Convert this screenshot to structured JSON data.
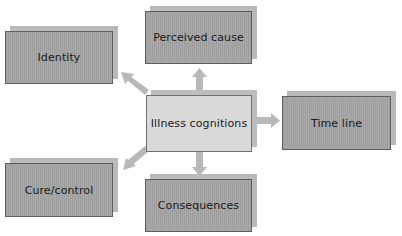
{
  "diagram": {
    "type": "hub-and-spoke concept map",
    "center": {
      "label": "Illness cognitions"
    },
    "nodes": [
      {
        "id": "identity",
        "label": "Identity",
        "position": "upper-left"
      },
      {
        "id": "perceived-cause",
        "label": "Perceived cause",
        "position": "top"
      },
      {
        "id": "time-line",
        "label": "Time line",
        "position": "right"
      },
      {
        "id": "cure-control",
        "label": "Cure/control",
        "position": "lower-left"
      },
      {
        "id": "consequences",
        "label": "Consequences",
        "position": "bottom"
      }
    ],
    "edges": [
      {
        "from": "Illness cognitions",
        "to": "Identity",
        "direction": "outward"
      },
      {
        "from": "Illness cognitions",
        "to": "Perceived cause",
        "direction": "outward"
      },
      {
        "from": "Illness cognitions",
        "to": "Time line",
        "direction": "outward"
      },
      {
        "from": "Illness cognitions",
        "to": "Cure/control",
        "direction": "outward"
      },
      {
        "from": "Illness cognitions",
        "to": "Consequences",
        "direction": "outward"
      }
    ],
    "colors": {
      "node_fill": "#a6a6a6",
      "center_fill": "#dcdcdc",
      "shadow": "#b9b9b9",
      "border": "#5e5e5e",
      "arrow": "#b8b8b8",
      "text": "#1a1a1a"
    }
  }
}
